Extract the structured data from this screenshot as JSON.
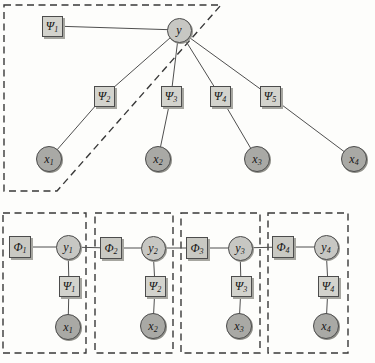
{
  "canvas": {
    "width": 375,
    "height": 363
  },
  "colors": {
    "background": "#fdfdfb",
    "factor_fill": "#d3d3cd",
    "phi_fill": "#c9c9c3",
    "y_fill": "#c7c7c3",
    "x_fill": "#a9a9a5",
    "node_border": "#4c4c4c",
    "edge": "#4f4f4f",
    "dash": "#383838"
  },
  "top_graph": {
    "region_points": "4,5 221,5 57,191 4,191",
    "nodes": [
      {
        "id": "psi1",
        "type": "factor",
        "label": "Ψ",
        "sub": "1",
        "x": 52,
        "y": 26
      },
      {
        "id": "y",
        "type": "var_y",
        "label": "y",
        "sub": "",
        "x": 179,
        "y": 30
      },
      {
        "id": "psi2",
        "type": "factor",
        "label": "Ψ",
        "sub": "2",
        "x": 104,
        "y": 96
      },
      {
        "id": "psi3",
        "type": "factor",
        "label": "Ψ",
        "sub": "3",
        "x": 171,
        "y": 96
      },
      {
        "id": "psi4",
        "type": "factor",
        "label": "Ψ",
        "sub": "4",
        "x": 220,
        "y": 96
      },
      {
        "id": "psi5",
        "type": "factor",
        "label": "Ψ",
        "sub": "5",
        "x": 270,
        "y": 96
      },
      {
        "id": "x1",
        "type": "var_x",
        "label": "x",
        "sub": "1",
        "x": 49,
        "y": 159
      },
      {
        "id": "x2",
        "type": "var_x",
        "label": "x",
        "sub": "2",
        "x": 158,
        "y": 159
      },
      {
        "id": "x3",
        "type": "var_x",
        "label": "x",
        "sub": "3",
        "x": 257,
        "y": 159
      },
      {
        "id": "x4",
        "type": "var_x",
        "label": "x",
        "sub": "4",
        "x": 354,
        "y": 159
      }
    ],
    "edges": [
      [
        "psi1",
        "y"
      ],
      [
        "y",
        "psi2"
      ],
      [
        "y",
        "psi3"
      ],
      [
        "y",
        "psi4"
      ],
      [
        "y",
        "psi5"
      ],
      [
        "psi2",
        "x1"
      ],
      [
        "psi3",
        "x2"
      ],
      [
        "psi4",
        "x3"
      ],
      [
        "psi5",
        "x4"
      ]
    ]
  },
  "bottom_graph": {
    "boxes": [
      {
        "x": 3,
        "y": 213,
        "w": 83,
        "h": 140
      },
      {
        "x": 95,
        "y": 213,
        "w": 78,
        "h": 140
      },
      {
        "x": 181,
        "y": 213,
        "w": 79,
        "h": 140
      },
      {
        "x": 268,
        "y": 213,
        "w": 80,
        "h": 140
      }
    ],
    "nodes": [
      {
        "id": "phi1",
        "type": "factor_phi",
        "label": "Φ",
        "sub": "1",
        "x": 20,
        "y": 247
      },
      {
        "id": "y1",
        "type": "var_y",
        "label": "y",
        "sub": "1",
        "x": 68,
        "y": 247
      },
      {
        "id": "b_psi1",
        "type": "factor",
        "label": "Ψ",
        "sub": "1",
        "x": 69,
        "y": 286
      },
      {
        "id": "b_x1",
        "type": "var_x",
        "label": "x",
        "sub": "1",
        "x": 68,
        "y": 327
      },
      {
        "id": "phi2",
        "type": "factor_phi",
        "label": "Φ",
        "sub": "2",
        "x": 111,
        "y": 248
      },
      {
        "id": "y2",
        "type": "var_y",
        "label": "y",
        "sub": "2",
        "x": 153,
        "y": 248
      },
      {
        "id": "b_psi2",
        "type": "factor",
        "label": "Ψ",
        "sub": "2",
        "x": 155,
        "y": 286
      },
      {
        "id": "b_x2",
        "type": "var_x",
        "label": "x",
        "sub": "2",
        "x": 153,
        "y": 326
      },
      {
        "id": "phi3",
        "type": "factor_phi",
        "label": "Φ",
        "sub": "3",
        "x": 197,
        "y": 248
      },
      {
        "id": "y3",
        "type": "var_y",
        "label": "y",
        "sub": "3",
        "x": 240,
        "y": 248
      },
      {
        "id": "b_psi3",
        "type": "factor",
        "label": "Ψ",
        "sub": "3",
        "x": 241,
        "y": 286
      },
      {
        "id": "b_x3",
        "type": "var_x",
        "label": "x",
        "sub": "3",
        "x": 239,
        "y": 326
      },
      {
        "id": "phi4",
        "type": "factor_phi",
        "label": "Φ",
        "sub": "4",
        "x": 283,
        "y": 247
      },
      {
        "id": "y4",
        "type": "var_y",
        "label": "y",
        "sub": "4",
        "x": 326,
        "y": 247
      },
      {
        "id": "b_psi4",
        "type": "factor",
        "label": "Ψ",
        "sub": "4",
        "x": 328,
        "y": 286
      },
      {
        "id": "b_x4",
        "type": "var_x",
        "label": "x",
        "sub": "4",
        "x": 326,
        "y": 326
      }
    ],
    "edges": [
      [
        "phi1",
        "y1"
      ],
      [
        "y1",
        "phi2"
      ],
      [
        "phi2",
        "y2"
      ],
      [
        "y2",
        "phi3"
      ],
      [
        "phi3",
        "y3"
      ],
      [
        "y3",
        "phi4"
      ],
      [
        "phi4",
        "y4"
      ],
      [
        "y1",
        "b_psi1"
      ],
      [
        "b_psi1",
        "b_x1"
      ],
      [
        "y2",
        "b_psi2"
      ],
      [
        "b_psi2",
        "b_x2"
      ],
      [
        "y3",
        "b_psi3"
      ],
      [
        "b_psi3",
        "b_x3"
      ],
      [
        "y4",
        "b_psi4"
      ],
      [
        "b_psi4",
        "b_x4"
      ]
    ]
  }
}
